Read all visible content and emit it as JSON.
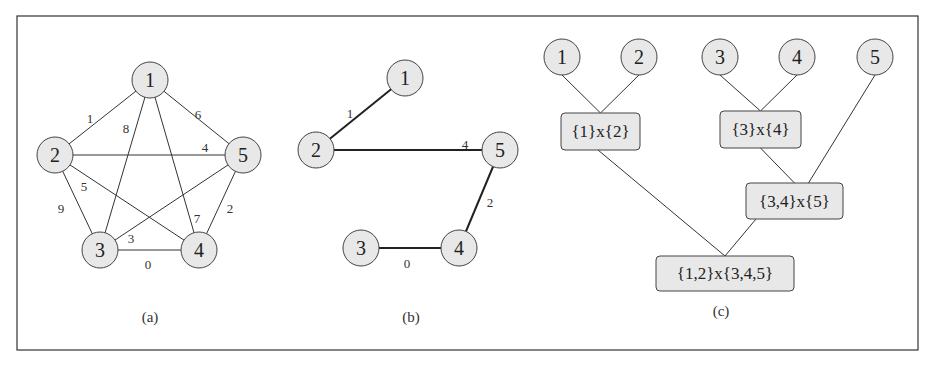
{
  "figure": {
    "panels": [
      {
        "caption": "(a)",
        "nodes": [
          "1",
          "2",
          "3",
          "4",
          "5"
        ],
        "edges": [
          {
            "from": "1",
            "to": "2",
            "weight": "1"
          },
          {
            "from": "1",
            "to": "3",
            "weight": "8"
          },
          {
            "from": "1",
            "to": "4",
            "weight": "7"
          },
          {
            "from": "1",
            "to": "5",
            "weight": "6"
          },
          {
            "from": "2",
            "to": "5",
            "weight": "4"
          },
          {
            "from": "2",
            "to": "4",
            "weight": "5"
          },
          {
            "from": "2",
            "to": "3",
            "weight": "9"
          },
          {
            "from": "3",
            "to": "5",
            "weight": "3"
          },
          {
            "from": "3",
            "to": "4",
            "weight": "0"
          },
          {
            "from": "5",
            "to": "4",
            "weight": "2"
          }
        ]
      },
      {
        "caption": "(b)",
        "nodes": [
          "1",
          "2",
          "3",
          "4",
          "5"
        ],
        "edges": [
          {
            "from": "1",
            "to": "2",
            "weight": "1"
          },
          {
            "from": "2",
            "to": "5",
            "weight": "4"
          },
          {
            "from": "5",
            "to": "4",
            "weight": "2"
          },
          {
            "from": "3",
            "to": "4",
            "weight": "0"
          }
        ]
      },
      {
        "caption": "(c)",
        "leaves": [
          "1",
          "2",
          "3",
          "4",
          "5"
        ],
        "joins": [
          {
            "id": "j12",
            "label": "{1}x{2}"
          },
          {
            "id": "j34",
            "label": "{3}x{4}"
          },
          {
            "id": "j345",
            "label": "{3,4}x{5}"
          },
          {
            "id": "jall",
            "label": "{1,2}x{3,4,5}"
          }
        ]
      }
    ]
  }
}
